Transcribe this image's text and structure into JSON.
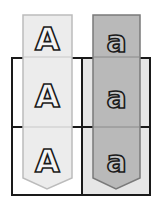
{
  "diagram": {
    "type": "punnett-square-2x2-with-allele-banners",
    "columns": [
      {
        "allele_label": "A",
        "banner_color": "#ececec",
        "banner_stroke": "#bcbcbc",
        "letters": [
          "A",
          "A",
          "A"
        ]
      },
      {
        "allele_label": "a",
        "banner_color": "#b9b9b9",
        "banner_stroke": "#7a7a7a",
        "letters": [
          "a",
          "a",
          "a"
        ]
      }
    ],
    "grid": {
      "rows": 2,
      "cols": 2,
      "border_color": "#1a1a1a",
      "cell_fill_left": "#ffffff",
      "cell_fill_right": "#e6e6e6"
    }
  }
}
